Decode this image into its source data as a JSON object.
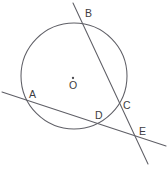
{
  "figure": {
    "kind": "geometry-diagram",
    "width": 168,
    "height": 170,
    "background_color": "#ffffff",
    "stroke_color": "#5f5f66",
    "label_color": "#3d3d42"
  },
  "circle": {
    "center_label": "O",
    "center_x": 74,
    "center_y": 76,
    "radius": 53,
    "center_dot_x": 73,
    "center_dot_y": 78,
    "center_label_x": 69,
    "center_label_y": 80
  },
  "points": [
    {
      "label": "A",
      "x": 28,
      "y": 99,
      "label_x": 29,
      "label_y": 89,
      "on_circle": true
    },
    {
      "label": "B",
      "x": 82,
      "y": 22,
      "label_x": 85,
      "label_y": 8,
      "on_circle": true
    },
    {
      "label": "C",
      "x": 120,
      "y": 103,
      "label_x": 123,
      "label_y": 100,
      "on_circle": true
    },
    {
      "label": "D",
      "x": 100,
      "y": 122,
      "label_x": 95,
      "label_y": 110,
      "on_circle": true
    },
    {
      "label": "E",
      "x": 137,
      "y": 133,
      "label_x": 139,
      "label_y": 126,
      "on_circle": false
    }
  ],
  "lines": [
    {
      "name": "secant-b-c-e",
      "through": "B, C, E",
      "x1": 73,
      "y1": 3,
      "x2": 148,
      "y2": 164
    },
    {
      "name": "secant-a-d-e",
      "through": "A, D, E",
      "x1": 2,
      "y1": 92,
      "x2": 166,
      "y2": 146
    }
  ]
}
